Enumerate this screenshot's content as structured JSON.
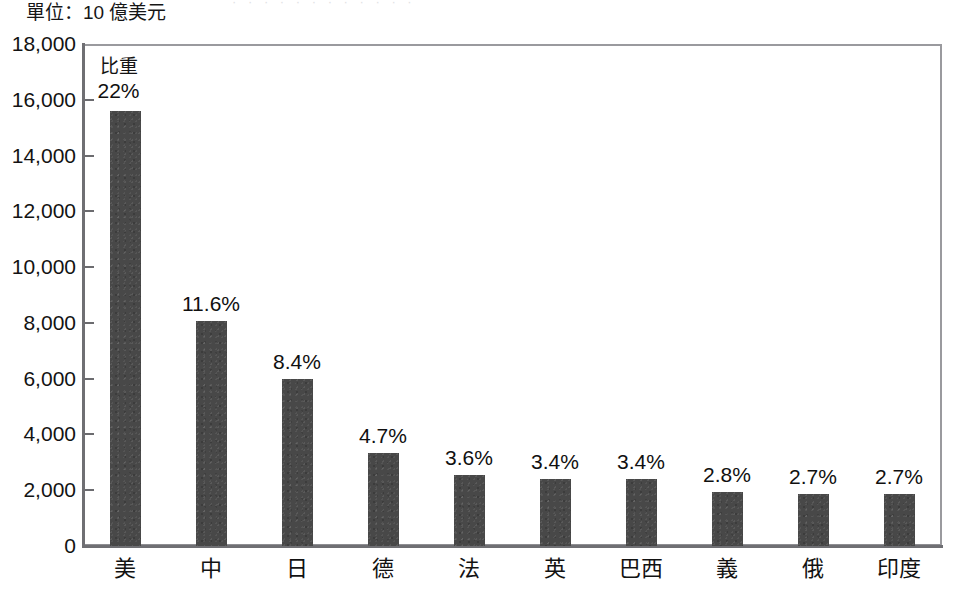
{
  "figure": {
    "unit_label": "單位：10 億美元",
    "title_sliver": "· · · · · · · · · · · ·",
    "ratio_caption": "比重"
  },
  "chart_data": {
    "type": "bar",
    "title": "",
    "subtitle": "",
    "xlabel": "",
    "ylabel": "單位：10 億美元",
    "ylim": [
      0,
      18000
    ],
    "ytick_step": 2000,
    "grid": false,
    "legend": "none",
    "bar_color": "#484848",
    "axis_color": "#6f6f73",
    "categories": [
      "美",
      "中",
      "日",
      "德",
      "法",
      "英",
      "巴西",
      "義",
      "俄",
      "印度"
    ],
    "values": [
      15600,
      8050,
      6000,
      3350,
      2550,
      2400,
      2400,
      1950,
      1850,
      1850
    ],
    "data_labels": [
      "22%",
      "11.6%",
      "8.4%",
      "4.7%",
      "3.6%",
      "3.4%",
      "3.4%",
      "2.8%",
      "2.7%",
      "2.7%"
    ],
    "ytick_labels": [
      "18,000",
      "16,000",
      "14,000",
      "12,000",
      "10,000",
      "8,000",
      "6,000",
      "4,000",
      "2,000",
      "0"
    ],
    "ytick_values": [
      18000,
      16000,
      14000,
      12000,
      10000,
      8000,
      6000,
      4000,
      2000,
      0
    ]
  }
}
